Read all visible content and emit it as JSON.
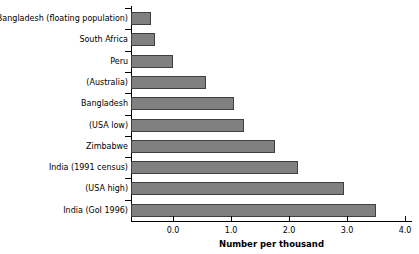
{
  "chart_data": {
    "type": "bar",
    "orientation": "horizontal",
    "title": "",
    "xlabel": "Number per thousand",
    "ylabel": "",
    "xlim": [
      -0.72,
      4.12
    ],
    "xticks": [
      0.0,
      1.0,
      2.0,
      3.0,
      4.0
    ],
    "xtick_labels": [
      "0.0",
      "1.0",
      "2.0",
      "3.0",
      "4.0"
    ],
    "grid": false,
    "legend": null,
    "bar_color": "#808080",
    "bar_edge_color": "#3f3f3f",
    "categories": [
      "Bangladesh (floating population)",
      "South Africa",
      "Peru",
      "(Australia)",
      "Bangladesh",
      "(USA low)",
      "Zimbabwe",
      "India (1991 census)",
      "(USA high)",
      "India (GoI 1996)"
    ],
    "values": [
      -0.38,
      -0.31,
      0.0,
      0.57,
      1.05,
      1.22,
      1.75,
      2.15,
      2.95,
      3.5
    ]
  }
}
